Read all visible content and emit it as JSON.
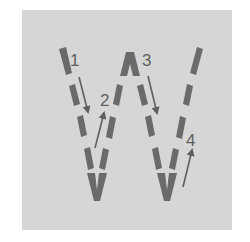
{
  "diagram": {
    "letter": "W",
    "background_color": "#d6d6d6",
    "stroke_color": "#6a6a6a",
    "strokes": [
      {
        "order": 1,
        "label": "1",
        "direction": "down",
        "from": [
          62,
          50
        ],
        "to": [
          96,
          205
        ]
      },
      {
        "order": 2,
        "label": "2",
        "direction": "up",
        "from": [
          96,
          205
        ],
        "to": [
          130,
          55
        ]
      },
      {
        "order": 3,
        "label": "3",
        "direction": "down",
        "from": [
          130,
          55
        ],
        "to": [
          166,
          205
        ]
      },
      {
        "order": 4,
        "label": "4",
        "direction": "up",
        "from": [
          166,
          205
        ],
        "to": [
          200,
          50
        ]
      }
    ],
    "labels": [
      "1",
      "2",
      "3",
      "4"
    ]
  }
}
